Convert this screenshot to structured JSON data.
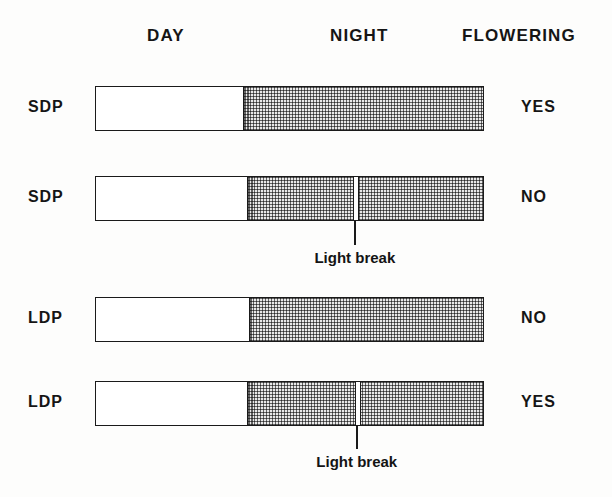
{
  "figure": {
    "headers": {
      "day": "DAY",
      "night": "NIGHT",
      "flowering": "FLOWERING"
    },
    "break_caption": "Light break",
    "colors": {
      "ink": "#1a1a1a",
      "day_fill": "#ffffff",
      "night_stipple": "#6f6f6f",
      "night_base": "#e9e9e9",
      "background": "#fdfdfc"
    }
  },
  "rows": [
    {
      "plant": "SDP",
      "result": "YES",
      "day_fraction": 0.378,
      "has_light_break": false,
      "light_break_position": null,
      "caption": null
    },
    {
      "plant": "SDP",
      "result": "NO",
      "day_fraction": 0.388,
      "has_light_break": true,
      "light_break_position": 0.668,
      "caption": "Light break"
    },
    {
      "plant": "LDP",
      "result": "NO",
      "day_fraction": 0.393,
      "has_light_break": false,
      "light_break_position": null,
      "caption": null
    },
    {
      "plant": "LDP",
      "result": "YES",
      "day_fraction": 0.388,
      "has_light_break": true,
      "light_break_position": 0.673,
      "caption": "Light break"
    }
  ]
}
